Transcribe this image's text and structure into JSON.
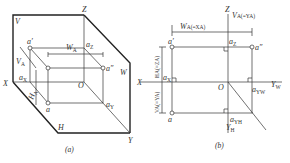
{
  "figure_a": {
    "caption": "(a)",
    "labels": {
      "V": "V",
      "Z": "Z",
      "X": "X",
      "Y": "Y",
      "H": "H",
      "W": "W",
      "O": "O",
      "a_prime": "a′",
      "a_double_prime": "a″",
      "a": "a",
      "aZ": "a",
      "aZ_sub": "Z",
      "aX": "a",
      "aX_sub": "X",
      "aY": "a",
      "aY_sub": "Y",
      "WA": "W",
      "WA_sub": "A",
      "VA": "V",
      "VA_sub": "A",
      "HA": "H",
      "HA_sub": "A"
    }
  },
  "figure_b": {
    "caption": "(b)",
    "labels": {
      "Z": "Z",
      "X": "X",
      "O": "O",
      "YW": "Y",
      "YW_sub": "W",
      "YH": "Y",
      "YH_sub": "H",
      "a_prime": "a′",
      "a_double_prime": "a″",
      "a": "a",
      "aZ": "a",
      "aZ_sub": "Z",
      "aX": "a",
      "aX_sub": "X",
      "aYW": "a",
      "aYW_sub": "YW",
      "aYH": "a",
      "aYH_sub": "YH",
      "WA_dim": "W",
      "WA_dim_rest": "A(=XA)",
      "VA_dim_top": "V",
      "VA_dim_top_rest": "A(=YA)",
      "HA_dim": "HA(=ZA)",
      "VA_dim_left": "VA(=YA)"
    }
  }
}
